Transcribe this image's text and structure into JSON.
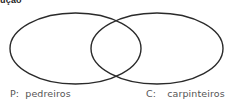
{
  "header": {
    "fragment": "ução"
  },
  "diagram": {
    "type": "venn",
    "stroke_color": "#2a2a2a",
    "sets": [
      {
        "key": "P:",
        "name": "pedreiros",
        "ellipse": {
          "cx": 75.5,
          "cy": 48.5,
          "rx": 65.5,
          "ry": 35.5
        }
      },
      {
        "key": "C:",
        "name": "carpinteiros",
        "ellipse": {
          "cx": 157,
          "cy": 48.5,
          "rx": 66,
          "ry": 35.5
        }
      }
    ]
  }
}
